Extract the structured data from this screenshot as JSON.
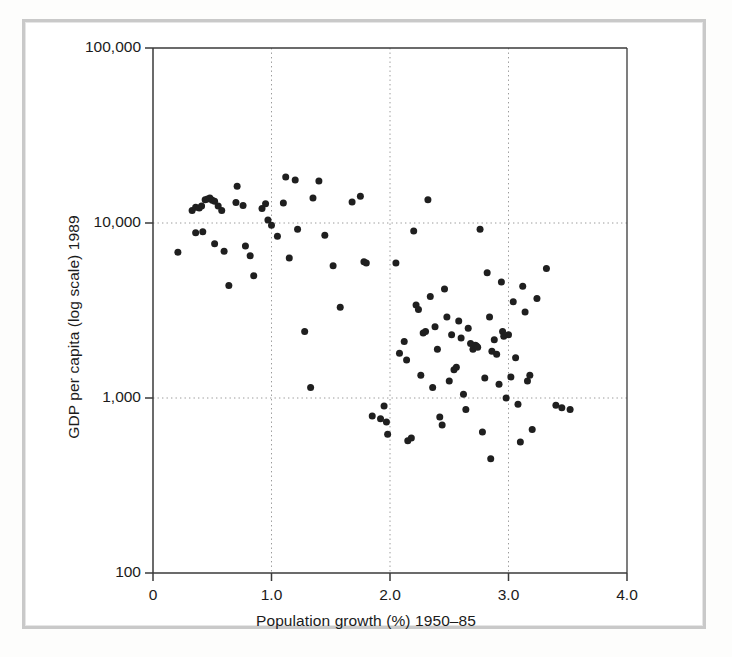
{
  "figure": {
    "background_color": "#ffffff",
    "frame_color": "#c9c9c9",
    "point_color": "#1f1f1f",
    "axis_color": "#3a3a3a",
    "grid_color": "#9a9a9a"
  },
  "axes": {
    "x_title": "Population growth (%) 1950–85",
    "y_title": "GDP per capita (log scale) 1989",
    "x_ticks": [
      "0",
      "1.0",
      "2.0",
      "3.0",
      "4.0"
    ],
    "x_tick_values": [
      0,
      1.0,
      2.0,
      3.0,
      4.0
    ],
    "y_ticks": [
      "100,000",
      "10,000",
      "1,000",
      "100"
    ],
    "y_tick_values": [
      100000,
      10000,
      1000,
      100
    ]
  },
  "chart_data": {
    "type": "scatter",
    "title": "",
    "subtitle": "",
    "xlabel": "Population growth (%) 1950–85",
    "ylabel": "GDP per capita (log scale) 1989",
    "xlim": [
      0,
      4.0
    ],
    "ylim": [
      100,
      100000
    ],
    "yscale": "log",
    "xscale": "linear",
    "grid": true,
    "grid_x_values": [
      1.0,
      2.0,
      3.0
    ],
    "grid_y_values": [
      10000,
      1000
    ],
    "legend": null,
    "legend_position": "none",
    "marker": "circle",
    "marker_color": "#1f1f1f",
    "marker_size_px": 7,
    "n_points": 110,
    "annotations": [],
    "points": [
      [
        0.21,
        6800
      ],
      [
        0.33,
        11800
      ],
      [
        0.36,
        12300
      ],
      [
        0.39,
        12200
      ],
      [
        0.41,
        12500
      ],
      [
        0.44,
        13600
      ],
      [
        0.46,
        13700
      ],
      [
        0.48,
        13900
      ],
      [
        0.5,
        13500
      ],
      [
        0.52,
        13300
      ],
      [
        0.55,
        12500
      ],
      [
        0.58,
        11800
      ],
      [
        0.42,
        8900
      ],
      [
        0.36,
        8800
      ],
      [
        0.52,
        7600
      ],
      [
        0.6,
        6900
      ],
      [
        0.64,
        4400
      ],
      [
        0.7,
        13100
      ],
      [
        0.71,
        16200
      ],
      [
        0.76,
        12600
      ],
      [
        0.78,
        7400
      ],
      [
        0.82,
        6500
      ],
      [
        0.85,
        5000
      ],
      [
        0.92,
        12100
      ],
      [
        0.95,
        12900
      ],
      [
        0.97,
        10400
      ],
      [
        1.0,
        9700
      ],
      [
        1.05,
        8400
      ],
      [
        1.12,
        18300
      ],
      [
        1.1,
        13000
      ],
      [
        1.15,
        6300
      ],
      [
        1.2,
        17600
      ],
      [
        1.22,
        9200
      ],
      [
        1.28,
        2400
      ],
      [
        1.33,
        1150
      ],
      [
        1.35,
        13900
      ],
      [
        1.4,
        17400
      ],
      [
        1.45,
        8500
      ],
      [
        1.52,
        5700
      ],
      [
        1.58,
        3300
      ],
      [
        1.68,
        13200
      ],
      [
        1.75,
        14200
      ],
      [
        1.78,
        6000
      ],
      [
        1.8,
        5900
      ],
      [
        1.85,
        790
      ],
      [
        1.92,
        760
      ],
      [
        1.95,
        900
      ],
      [
        1.97,
        730
      ],
      [
        1.98,
        620
      ],
      [
        2.05,
        5900
      ],
      [
        2.08,
        1800
      ],
      [
        2.12,
        2100
      ],
      [
        2.14,
        1650
      ],
      [
        2.15,
        570
      ],
      [
        2.18,
        590
      ],
      [
        2.2,
        9000
      ],
      [
        2.22,
        3400
      ],
      [
        2.24,
        3200
      ],
      [
        2.26,
        1350
      ],
      [
        2.28,
        2350
      ],
      [
        2.3,
        2400
      ],
      [
        2.32,
        13600
      ],
      [
        2.34,
        3800
      ],
      [
        2.36,
        1150
      ],
      [
        2.38,
        2550
      ],
      [
        2.4,
        1900
      ],
      [
        2.42,
        780
      ],
      [
        2.44,
        700
      ],
      [
        2.46,
        4200
      ],
      [
        2.48,
        2900
      ],
      [
        2.5,
        1250
      ],
      [
        2.52,
        2300
      ],
      [
        2.54,
        1450
      ],
      [
        2.56,
        1500
      ],
      [
        2.58,
        2750
      ],
      [
        2.6,
        2200
      ],
      [
        2.62,
        1050
      ],
      [
        2.64,
        860
      ],
      [
        2.66,
        2500
      ],
      [
        2.68,
        2050
      ],
      [
        2.7,
        1900
      ],
      [
        2.72,
        2000
      ],
      [
        2.73,
        1980
      ],
      [
        2.74,
        1950
      ],
      [
        2.76,
        9200
      ],
      [
        2.78,
        640
      ],
      [
        2.8,
        1300
      ],
      [
        2.82,
        5200
      ],
      [
        2.84,
        2900
      ],
      [
        2.85,
        450
      ],
      [
        2.86,
        1850
      ],
      [
        2.88,
        2150
      ],
      [
        2.9,
        1780
      ],
      [
        2.92,
        1200
      ],
      [
        2.94,
        4600
      ],
      [
        2.95,
        2400
      ],
      [
        2.96,
        2250
      ],
      [
        2.98,
        1000
      ],
      [
        3.0,
        2300
      ],
      [
        3.02,
        1320
      ],
      [
        3.04,
        3550
      ],
      [
        3.06,
        1700
      ],
      [
        3.08,
        920
      ],
      [
        3.1,
        560
      ],
      [
        3.12,
        4350
      ],
      [
        3.14,
        3100
      ],
      [
        3.16,
        1250
      ],
      [
        3.18,
        1350
      ],
      [
        3.2,
        660
      ],
      [
        3.24,
        3700
      ],
      [
        3.32,
        5500
      ],
      [
        3.4,
        910
      ],
      [
        3.45,
        880
      ],
      [
        3.52,
        860
      ]
    ]
  }
}
